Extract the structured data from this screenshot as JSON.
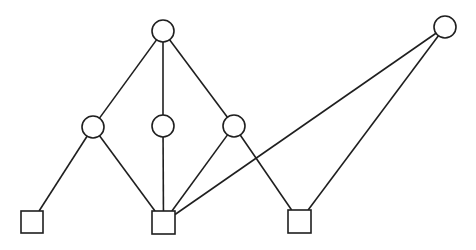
{
  "diagram": {
    "type": "graph",
    "width": 476,
    "height": 250,
    "stroke_color": "#1f1f1f",
    "fill_color": "#ffffff",
    "nodes": [
      {
        "id": "c_top",
        "shape": "circle",
        "cx": 163,
        "cy": 31,
        "r": 11
      },
      {
        "id": "c_right",
        "shape": "circle",
        "cx": 445,
        "cy": 27,
        "r": 11
      },
      {
        "id": "c_mid_left",
        "shape": "circle",
        "cx": 93,
        "cy": 127,
        "r": 11
      },
      {
        "id": "c_mid_center",
        "shape": "circle",
        "cx": 163,
        "cy": 126,
        "r": 11
      },
      {
        "id": "c_mid_right",
        "shape": "circle",
        "cx": 234,
        "cy": 126,
        "r": 11
      },
      {
        "id": "s_left",
        "shape": "square",
        "x": 21,
        "y": 211,
        "size": 22
      },
      {
        "id": "s_center",
        "shape": "square",
        "x": 152,
        "y": 211,
        "size": 23
      },
      {
        "id": "s_right",
        "shape": "square",
        "x": 288,
        "y": 210,
        "size": 23
      }
    ],
    "edges": [
      {
        "from": "c_top",
        "to": "c_mid_left"
      },
      {
        "from": "c_top",
        "to": "c_mid_center"
      },
      {
        "from": "c_top",
        "to": "c_mid_right"
      },
      {
        "from": "c_mid_left",
        "to": "s_left"
      },
      {
        "from": "c_mid_left",
        "to": "s_center"
      },
      {
        "from": "c_mid_center",
        "to": "s_center"
      },
      {
        "from": "c_mid_right",
        "to": "s_center"
      },
      {
        "from": "c_mid_right",
        "to": "s_right"
      },
      {
        "from": "c_right",
        "to": "s_center"
      },
      {
        "from": "c_right",
        "to": "s_right"
      }
    ]
  }
}
